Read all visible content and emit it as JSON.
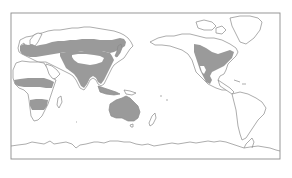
{
  "map": {
    "projection": "equirectangular",
    "center": "Pacific-centered (~150°E)",
    "frame": {
      "x": 11,
      "y": 13,
      "width": 269,
      "height": 146
    },
    "colors": {
      "background": "#ffffff",
      "coastline": "#8a8a8a",
      "shaded_region": "#9a9a9a",
      "frame": "#8c8c8c"
    },
    "shaded_regions": [
      {
        "name": "Europe-Central Asia band",
        "description": "Europe through central/east Asia mid-latitudes"
      },
      {
        "name": "South and East Asia",
        "description": "India, Indochina, China, Korea, Japan"
      },
      {
        "name": "Africa northern band",
        "description": "Sahel band across Africa"
      },
      {
        "name": "Africa southern band",
        "description": "Southern-central Africa band"
      },
      {
        "name": "Australia",
        "description": "Entire Australian continent"
      },
      {
        "name": "North America",
        "description": "Western plains to eastern US"
      }
    ]
  }
}
